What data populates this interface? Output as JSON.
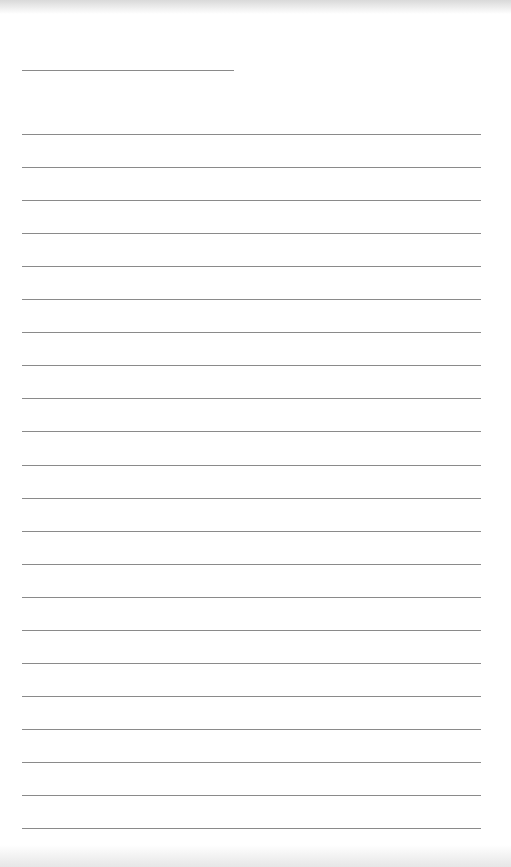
{
  "page": {
    "type": "lined-paper",
    "background": "#ffffff",
    "line_color": "#8a8a8a",
    "title_line": {
      "x": 22,
      "y": 70,
      "width": 212
    },
    "ruled_lines": {
      "count": 22,
      "start_y": 134,
      "spacing": 33.05,
      "x": 22,
      "width": 459
    }
  }
}
